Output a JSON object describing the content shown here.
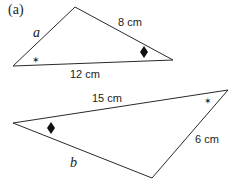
{
  "part_label": "(a)",
  "triangles": [
    {
      "name": "top",
      "vertices": [
        [
          13,
          66
        ],
        [
          75,
          7
        ],
        [
          173,
          60
        ]
      ],
      "side_labels": {
        "left": "a",
        "upper_right": "8 cm",
        "bottom": "12 cm"
      },
      "angle_marks": {
        "left_vertex": "star",
        "right_vertex": "diamond"
      }
    },
    {
      "name": "bottom",
      "vertices": [
        [
          13,
          123
        ],
        [
          228,
          90
        ],
        [
          152,
          178
        ]
      ],
      "side_labels": {
        "top": "15 cm",
        "lower_right": "6 cm",
        "lower_left": "b"
      },
      "angle_marks": {
        "left_vertex": "diamond",
        "right_vertex": "star"
      }
    }
  ],
  "colors": {
    "line": "#2a2a2a",
    "text": "#222222",
    "background": "#ffffff"
  }
}
